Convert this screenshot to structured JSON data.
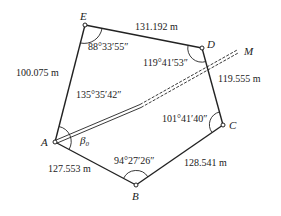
{
  "diagram": {
    "type": "closed traverse polygon",
    "points": {
      "A": {
        "label": "A",
        "x": 55,
        "y": 142
      },
      "B": {
        "label": "B",
        "x": 136,
        "y": 185
      },
      "C": {
        "label": "C",
        "x": 223,
        "y": 125
      },
      "D": {
        "label": "D",
        "x": 202,
        "y": 48
      },
      "E": {
        "label": "E",
        "x": 85,
        "y": 25
      },
      "M": {
        "label": "M"
      }
    },
    "sides": {
      "AB": "127.553 m",
      "BC": "128.541 m",
      "CD": "119.555 m",
      "DE": "131.192 m",
      "EA": "100.075 m"
    },
    "angles": {
      "A": "135°35′42″",
      "B": "94°27′26″",
      "C": "101°41′40″",
      "D": "119°41′53″",
      "E": "88°33′55″",
      "beta0": "β",
      "beta0_sub": "0"
    }
  }
}
